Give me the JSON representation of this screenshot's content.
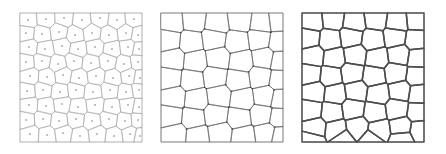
{
  "figure": {
    "title": "",
    "background_color": "#ffffff",
    "width": 446,
    "height": 154,
    "panel_count": 3
  },
  "chart_data": {
    "type": "diagram",
    "subtype": "voronoi-tessellation-triptych",
    "title": "",
    "xlabel": "",
    "ylabel": "",
    "grid": false,
    "legend": null,
    "panels": [
      {
        "id": "panel-1",
        "label": "",
        "caption": "",
        "edge_color": "#9a9a9a",
        "edge_width": 0.5,
        "frame_color": "#bdbdbd",
        "frame_width": 0.6,
        "fill_color": "#ffffff",
        "show_seed_points": true,
        "show_vertex_points": false,
        "seed_point_color": "#555555",
        "seed_point_radius": 0.7,
        "cell_count": 60,
        "x": 20,
        "y": 13,
        "w": 122,
        "h": 129,
        "seeds": [
          [
            8,
            7
          ],
          [
            26,
            6
          ],
          [
            44,
            5
          ],
          [
            62,
            7
          ],
          [
            80,
            5
          ],
          [
            97,
            7
          ],
          [
            114,
            6
          ],
          [
            6,
            20
          ],
          [
            22,
            21
          ],
          [
            39,
            19
          ],
          [
            55,
            22
          ],
          [
            72,
            20
          ],
          [
            89,
            22
          ],
          [
            106,
            20
          ],
          [
            118,
            22
          ],
          [
            9,
            34
          ],
          [
            25,
            36
          ],
          [
            42,
            33
          ],
          [
            58,
            36
          ],
          [
            75,
            34
          ],
          [
            92,
            36
          ],
          [
            108,
            34
          ],
          [
            119,
            36
          ],
          [
            6,
            49
          ],
          [
            22,
            48
          ],
          [
            38,
            51
          ],
          [
            54,
            48
          ],
          [
            71,
            50
          ],
          [
            88,
            48
          ],
          [
            104,
            51
          ],
          [
            118,
            49
          ],
          [
            10,
            63
          ],
          [
            27,
            64
          ],
          [
            43,
            62
          ],
          [
            59,
            65
          ],
          [
            76,
            63
          ],
          [
            93,
            65
          ],
          [
            109,
            63
          ],
          [
            120,
            65
          ],
          [
            7,
            78
          ],
          [
            23,
            77
          ],
          [
            40,
            79
          ],
          [
            56,
            77
          ],
          [
            73,
            79
          ],
          [
            90,
            77
          ],
          [
            106,
            79
          ],
          [
            119,
            77
          ],
          [
            9,
            92
          ],
          [
            26,
            93
          ],
          [
            42,
            91
          ],
          [
            58,
            94
          ],
          [
            75,
            92
          ],
          [
            92,
            94
          ],
          [
            108,
            92
          ],
          [
            119,
            94
          ],
          [
            6,
            107
          ],
          [
            23,
            106
          ],
          [
            39,
            108
          ],
          [
            56,
            106
          ],
          [
            72,
            108
          ],
          [
            89,
            106
          ],
          [
            105,
            108
          ],
          [
            118,
            107
          ],
          [
            10,
            121
          ],
          [
            27,
            122
          ],
          [
            43,
            120
          ],
          [
            60,
            123
          ],
          [
            77,
            121
          ],
          [
            94,
            123
          ],
          [
            110,
            121
          ],
          [
            120,
            123
          ]
        ]
      },
      {
        "id": "panel-2",
        "label": "",
        "caption": "",
        "edge_color": "#6e6e6e",
        "edge_width": 0.75,
        "frame_color": "#bdbdbd",
        "frame_width": 0.6,
        "fill_color": "#ffffff",
        "show_seed_points": false,
        "show_vertex_points": true,
        "vertex_point_color": "#4a4a4a",
        "vertex_point_radius": 0.85,
        "cell_count": 40,
        "x": 161,
        "y": 13,
        "w": 122,
        "h": 129,
        "seeds": [
          [
            11,
            9
          ],
          [
            33,
            7
          ],
          [
            56,
            10
          ],
          [
            79,
            7
          ],
          [
            101,
            10
          ],
          [
            117,
            8
          ],
          [
            8,
            27
          ],
          [
            30,
            29
          ],
          [
            53,
            26
          ],
          [
            76,
            29
          ],
          [
            99,
            26
          ],
          [
            118,
            29
          ],
          [
            12,
            46
          ],
          [
            34,
            48
          ],
          [
            57,
            45
          ],
          [
            80,
            48
          ],
          [
            103,
            45
          ],
          [
            119,
            48
          ],
          [
            9,
            65
          ],
          [
            31,
            67
          ],
          [
            54,
            64
          ],
          [
            77,
            67
          ],
          [
            100,
            64
          ],
          [
            118,
            67
          ],
          [
            13,
            84
          ],
          [
            35,
            86
          ],
          [
            58,
            83
          ],
          [
            81,
            86
          ],
          [
            104,
            83
          ],
          [
            119,
            86
          ],
          [
            10,
            103
          ],
          [
            32,
            105
          ],
          [
            55,
            102
          ],
          [
            78,
            105
          ],
          [
            101,
            102
          ],
          [
            118,
            105
          ],
          [
            14,
            121
          ],
          [
            36,
            123
          ],
          [
            59,
            120
          ],
          [
            82,
            123
          ],
          [
            105,
            120
          ],
          [
            119,
            123
          ]
        ]
      },
      {
        "id": "panel-3",
        "label": "",
        "caption": "",
        "edge_color": "#4d4d4d",
        "edge_width": 1.5,
        "frame_color": "#c7c7c7",
        "frame_width": 0.6,
        "fill_color": "#ffffff",
        "show_seed_points": false,
        "show_vertex_points": false,
        "cell_count": 45,
        "x": 302,
        "y": 13,
        "w": 122,
        "h": 129,
        "seeds": [
          [
            10,
            8
          ],
          [
            31,
            6
          ],
          [
            52,
            9
          ],
          [
            74,
            6
          ],
          [
            95,
            9
          ],
          [
            115,
            7
          ],
          [
            7,
            25
          ],
          [
            28,
            27
          ],
          [
            49,
            24
          ],
          [
            71,
            27
          ],
          [
            93,
            24
          ],
          [
            114,
            27
          ],
          [
            11,
            43
          ],
          [
            32,
            45
          ],
          [
            53,
            42
          ],
          [
            75,
            45
          ],
          [
            97,
            42
          ],
          [
            116,
            45
          ],
          [
            8,
            61
          ],
          [
            29,
            63
          ],
          [
            50,
            60
          ],
          [
            72,
            63
          ],
          [
            94,
            60
          ],
          [
            115,
            63
          ],
          [
            12,
            79
          ],
          [
            33,
            81
          ],
          [
            54,
            78
          ],
          [
            76,
            81
          ],
          [
            98,
            78
          ],
          [
            117,
            81
          ],
          [
            9,
            97
          ],
          [
            30,
            99
          ],
          [
            51,
            96
          ],
          [
            73,
            99
          ],
          [
            95,
            96
          ],
          [
            116,
            99
          ],
          [
            13,
            115
          ],
          [
            34,
            117
          ],
          [
            55,
            114
          ],
          [
            77,
            117
          ],
          [
            99,
            114
          ],
          [
            118,
            117
          ],
          [
            10,
            127
          ],
          [
            40,
            126
          ],
          [
            70,
            127
          ],
          [
            100,
            126
          ]
        ]
      }
    ]
  }
}
